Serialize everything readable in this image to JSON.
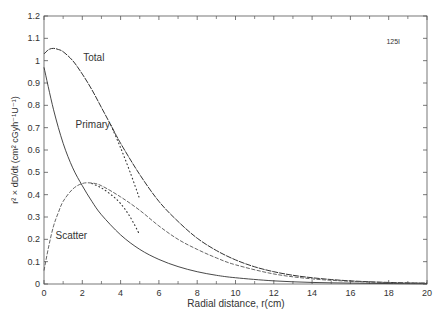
{
  "chart_data": {
    "type": "line",
    "title": "",
    "xlabel": "Radial distance, r(cm)",
    "ylabel": "r² × dD/dt (cm² cGyh⁻¹U⁻¹)",
    "xlim": [
      0,
      20
    ],
    "ylim": [
      0,
      1.2
    ],
    "xticks": [
      0,
      2,
      4,
      6,
      8,
      10,
      12,
      14,
      16,
      18,
      20
    ],
    "yticks": [
      0,
      0.1,
      0.2,
      0.3,
      0.4,
      0.5,
      0.6,
      0.7,
      0.8,
      0.9,
      1,
      1.1,
      1.2
    ],
    "grid": false,
    "legend": "none (inline curve labels)",
    "annotation": "125I",
    "series": [
      {
        "name": "Total",
        "style": "solid-dashed",
        "x": [
          0,
          0.25,
          0.5,
          0.75,
          1,
          1.5,
          2,
          2.5,
          3,
          3.5,
          4,
          5,
          6,
          7,
          8,
          9,
          10,
          11,
          12,
          13,
          14,
          15,
          16,
          17,
          18,
          19,
          20
        ],
        "y": [
          1.03,
          1.05,
          1.055,
          1.05,
          1.04,
          1.0,
          0.94,
          0.87,
          0.79,
          0.71,
          0.63,
          0.49,
          0.37,
          0.28,
          0.205,
          0.15,
          0.108,
          0.077,
          0.055,
          0.039,
          0.028,
          0.02,
          0.014,
          0.01,
          0.007,
          0.005,
          0.004
        ]
      },
      {
        "name": "Total (dotted fit)",
        "style": "dotted",
        "x": [
          3.5,
          4,
          4.5,
          5
        ],
        "y": [
          0.71,
          0.61,
          0.5,
          0.38
        ]
      },
      {
        "name": "Primary",
        "style": "solid",
        "x": [
          0,
          0.5,
          1,
          1.5,
          2,
          2.5,
          3,
          4,
          5,
          6,
          7,
          8,
          9,
          10,
          12,
          14,
          16,
          18,
          20
        ],
        "y": [
          0.97,
          0.78,
          0.63,
          0.52,
          0.44,
          0.37,
          0.31,
          0.22,
          0.155,
          0.11,
          0.078,
          0.055,
          0.039,
          0.028,
          0.014,
          0.007,
          0.004,
          0.002,
          0.001
        ]
      },
      {
        "name": "Scatter",
        "style": "dashed",
        "x": [
          0,
          0.25,
          0.5,
          0.75,
          1,
          1.5,
          2,
          2.5,
          3,
          4,
          5,
          6,
          7,
          8,
          9,
          10,
          12,
          14,
          16,
          18,
          20
        ],
        "y": [
          0.06,
          0.17,
          0.26,
          0.32,
          0.37,
          0.425,
          0.45,
          0.452,
          0.44,
          0.39,
          0.33,
          0.26,
          0.2,
          0.155,
          0.117,
          0.086,
          0.045,
          0.023,
          0.012,
          0.006,
          0.003
        ]
      },
      {
        "name": "Scatter (dotted fit)",
        "style": "dotted",
        "x": [
          2.5,
          3,
          3.5,
          4,
          4.5,
          5
        ],
        "y": [
          0.45,
          0.43,
          0.4,
          0.36,
          0.3,
          0.22
        ]
      }
    ],
    "labels": [
      {
        "text": "Total",
        "x": 2.05,
        "y": 1.0
      },
      {
        "text": "Primary",
        "x": 1.65,
        "y": 0.7
      },
      {
        "text": "Scatter",
        "x": 0.6,
        "y": 0.2
      }
    ]
  }
}
